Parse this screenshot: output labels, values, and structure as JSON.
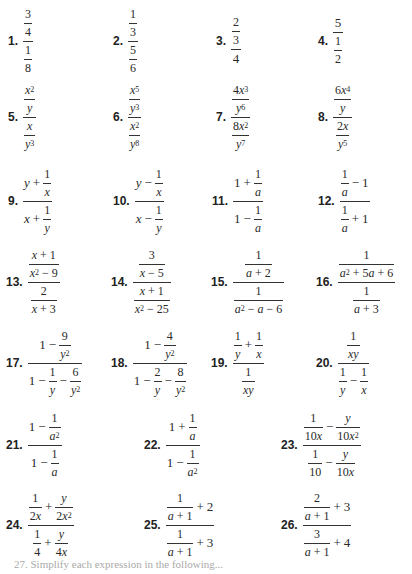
{
  "exercises": [
    {
      "n": "1.",
      "num": "3/4",
      "den": "1/8"
    },
    {
      "n": "2.",
      "num": "1/3",
      "den": "5/6"
    },
    {
      "n": "3.",
      "num": "2/3",
      "den": "4"
    },
    {
      "n": "4.",
      "num": "5",
      "den": "1/2"
    },
    {
      "n": "5.",
      "num": "x^2/y",
      "den": "x/y^3"
    },
    {
      "n": "6.",
      "num": "x^5/y^3",
      "den": "x^2/y^8"
    },
    {
      "n": "7.",
      "num": "4x^3/y^6",
      "den": "8x^2/y^7"
    },
    {
      "n": "8.",
      "num": "6x^4/y",
      "den": "2x/y^5"
    },
    {
      "n": "9.",
      "num": "y + 1/x",
      "den": "x + 1/y"
    },
    {
      "n": "10.",
      "num": "y − 1/x",
      "den": "x − 1/y"
    },
    {
      "n": "11.",
      "num": "1 + 1/a",
      "den": "1 − 1/a"
    },
    {
      "n": "12.",
      "num": "1/a − 1",
      "den": "1/a + 1"
    },
    {
      "n": "13.",
      "num": "(x + 1)/(x^2 − 9)",
      "den": "2/(x + 3)"
    },
    {
      "n": "14.",
      "num": "3/(x − 5)",
      "den": "(x + 1)/(x^2 − 25)"
    },
    {
      "n": "15.",
      "num": "1/(a + 2)",
      "den": "1/(a^2 − a − 6)"
    },
    {
      "n": "16.",
      "num": "1/(a^2 + 5a + 6)",
      "den": "1/(a + 3)"
    },
    {
      "n": "17.",
      "num": "1 − 9/y^2",
      "den": "1 − 1/y − 6/y^2"
    },
    {
      "n": "18.",
      "num": "1 − 4/y^2",
      "den": "1 − 2/y − 8/y^2"
    },
    {
      "n": "19.",
      "num": "1/y + 1/x",
      "den": "1/(xy)"
    },
    {
      "n": "20.",
      "num": "1/(xy)",
      "den": "1/y − 1/x"
    },
    {
      "n": "21.",
      "num": "1 − 1/a^2",
      "den": "1 − 1/a"
    },
    {
      "n": "22.",
      "num": "1 + 1/a",
      "den": "1 − 1/a^2"
    },
    {
      "n": "23.",
      "num": "1/(10x) − y/(10x^2)",
      "den": "1/10 − y/(10x)"
    },
    {
      "n": "24.",
      "num": "1/(2x) + y/(2x^2)",
      "den": "1/4 + y/(4x)"
    },
    {
      "n": "25.",
      "num": "1/(a + 1) + 2",
      "den": "1/(a + 1) + 3"
    },
    {
      "n": "26.",
      "num": "2/(a + 1) + 3",
      "den": "3/(a + 1) + 4"
    }
  ],
  "labels": [
    "1.",
    "2.",
    "3.",
    "4.",
    "5.",
    "6.",
    "7.",
    "8.",
    "9.",
    "10.",
    "11.",
    "12.",
    "13.",
    "14.",
    "15.",
    "16.",
    "17.",
    "18.",
    "19.",
    "20.",
    "21.",
    "22.",
    "23.",
    "24.",
    "25.",
    "26."
  ],
  "footer_text": "27. Simplify each expression in the following..."
}
